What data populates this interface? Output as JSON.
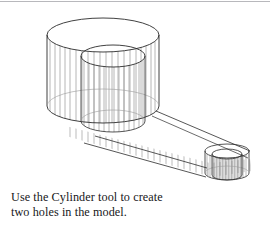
{
  "figure": {
    "name": "isometric-wireframe-mechanical-part",
    "line_color": "#2b2b2b",
    "mesh_color": "#8c8c8c",
    "background": "#ffffff",
    "parts": [
      {
        "name": "large-cylinder",
        "label": "large cylindrical boss"
      },
      {
        "name": "large-hole",
        "label": "large through hole"
      },
      {
        "name": "base-plate",
        "label": "tapered base plate"
      },
      {
        "name": "small-cylinder",
        "label": "small cylindrical boss"
      },
      {
        "name": "small-hole",
        "label": "small through hole"
      }
    ]
  },
  "caption": {
    "line1": "Use the Cylinder tool to create",
    "line2": "two holes in the model.",
    "full_text": "Use the Cylinder tool to create two holes in the model."
  }
}
